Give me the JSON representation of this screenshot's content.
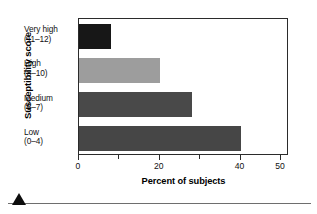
{
  "chart_data": {
    "type": "bar",
    "orientation": "horizontal",
    "title": "",
    "xlabel": "Percent of subjects",
    "ylabel": "Susceptibility score",
    "categories": [
      "Very high (11–12)",
      "High (8–10)",
      "Medium (5–7)",
      "Low (0–4)"
    ],
    "category_lines": [
      {
        "line1": "Very high",
        "line2": "(11–12)"
      },
      {
        "line1": "High",
        "line2": "(8–10)"
      },
      {
        "line1": "Medium",
        "line2": "(5–7)"
      },
      {
        "line1": "Low",
        "line2": "(0–4)"
      }
    ],
    "values": [
      8,
      20,
      28,
      40
    ],
    "bar_colors": [
      "#171717",
      "#9d9d9d",
      "#494949",
      "#464646"
    ],
    "xlim": [
      0,
      52
    ],
    "xticks": [
      0,
      10,
      20,
      30,
      40,
      50
    ],
    "xtick_labels": [
      "0",
      "",
      "20",
      "",
      "40",
      "50"
    ],
    "grid": false,
    "legend": "none",
    "axis_color": "#2b2b2b"
  },
  "figure": {
    "y_axis_title": "Susceptibility score",
    "x_axis_title": "Percent of subjects"
  },
  "footer": {
    "marker": "triangle-marker",
    "rule": "horizontal-rule"
  }
}
